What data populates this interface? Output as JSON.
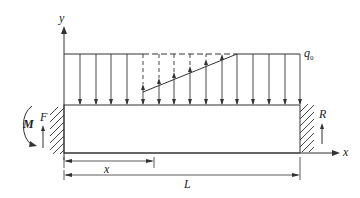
{
  "diagram": {
    "labels": {
      "y_axis": "y",
      "x_axis": "x",
      "load_intensity": "q",
      "load_intensity_sub": "0",
      "moment": "M",
      "left_force": "F",
      "right_reaction": "R",
      "dim_x": "x",
      "dim_length": "L"
    },
    "geometry": {
      "beam_left": 64,
      "beam_right": 300,
      "beam_top": 105,
      "beam_bottom": 153,
      "load_top": 54,
      "arrow_x_positions": [
        64,
        80,
        96,
        111,
        127,
        143,
        159,
        174,
        190,
        206,
        222,
        237,
        253,
        269,
        285,
        300
      ],
      "triangle_start": {
        "x": 143,
        "y": 92
      },
      "triangle_end": {
        "x": 237,
        "y": 54
      }
    },
    "colors": {
      "line": "#333333",
      "background": "#ffffff"
    }
  }
}
